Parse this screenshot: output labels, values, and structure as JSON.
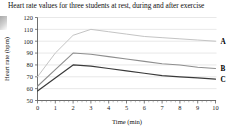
{
  "chart_data": {
    "type": "line",
    "title": "Heart rate values for three students at rest, during and after exercise",
    "xlabel": "Time (min)",
    "ylabel": "Heart rate (bpm)",
    "xlim": [
      0,
      10
    ],
    "ylim": [
      50,
      120
    ],
    "x_ticks": [
      0,
      1,
      2,
      3,
      4,
      5,
      6,
      7,
      8,
      9,
      10
    ],
    "y_ticks": [
      50,
      60,
      70,
      80,
      90,
      100,
      110,
      120
    ],
    "grid": "horizontal",
    "legend_position": "right-inline",
    "x": [
      0,
      1,
      2,
      3,
      4,
      5,
      6,
      7,
      8,
      9,
      10
    ],
    "series": [
      {
        "name": "A",
        "color": "#c4c4c4",
        "values": [
          70,
          90,
          105,
          110,
          108,
          106,
          104,
          103,
          102,
          101,
          100
        ]
      },
      {
        "name": "B",
        "color": "#8e8e8e",
        "values": [
          62,
          76,
          90,
          89,
          87,
          85,
          83,
          81,
          80,
          78,
          77
        ]
      },
      {
        "name": "C",
        "color": "#3a3a3a",
        "values": [
          58,
          69,
          80,
          79,
          77,
          75,
          73,
          71,
          70,
          69,
          68
        ]
      }
    ]
  },
  "colors": {
    "background": "#ffffff",
    "grid": "#d9d9d9",
    "axis": "#4a4a4a",
    "text": "#111111"
  }
}
